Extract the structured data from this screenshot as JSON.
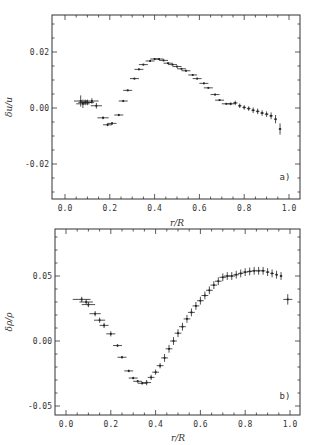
{
  "chart_data": [
    {
      "type": "scatter",
      "panel_label": "a)",
      "title": "",
      "xlabel": "r/R",
      "ylabel": "δu/u",
      "xlim": [
        -0.05,
        1.04
      ],
      "ylim": [
        -0.032,
        0.033
      ],
      "xticks": [
        "0.0",
        "0.2",
        "0.4",
        "0.6",
        "0.8",
        "1.0"
      ],
      "yticks": [
        "-0.02",
        "0.00",
        "0.02"
      ],
      "grid": false,
      "error_bars": true,
      "series": [
        {
          "name": "δu/u",
          "points": [
            {
              "x": 0.07,
              "y": 0.0025,
              "xerr": 0.03,
              "yerr": 0.002
            },
            {
              "x": 0.08,
              "y": 0.0015,
              "xerr": 0.03,
              "yerr": 0.0015
            },
            {
              "x": 0.09,
              "y": 0.002,
              "xerr": 0.03,
              "yerr": 0.001
            },
            {
              "x": 0.1,
              "y": 0.002,
              "xerr": 0.03,
              "yerr": 0.001
            },
            {
              "x": 0.12,
              "y": 0.0025,
              "xerr": 0.03,
              "yerr": 0.001
            },
            {
              "x": 0.14,
              "y": 0.0008,
              "xerr": 0.025,
              "yerr": 0.001
            },
            {
              "x": 0.17,
              "y": -0.0035,
              "xerr": 0.025,
              "yerr": 0.0005
            },
            {
              "x": 0.19,
              "y": -0.006,
              "xerr": 0.02,
              "yerr": 0.0005
            },
            {
              "x": 0.21,
              "y": -0.0055,
              "xerr": 0.02,
              "yerr": 0.0005
            },
            {
              "x": 0.24,
              "y": -0.0025,
              "xerr": 0.02,
              "yerr": 0.0004
            },
            {
              "x": 0.26,
              "y": 0.0025,
              "xerr": 0.02,
              "yerr": 0.0004
            },
            {
              "x": 0.28,
              "y": 0.0063,
              "xerr": 0.02,
              "yerr": 0.0003
            },
            {
              "x": 0.31,
              "y": 0.0105,
              "xerr": 0.02,
              "yerr": 0.0003
            },
            {
              "x": 0.33,
              "y": 0.0138,
              "xerr": 0.02,
              "yerr": 0.0003
            },
            {
              "x": 0.35,
              "y": 0.0155,
              "xerr": 0.02,
              "yerr": 0.0003
            },
            {
              "x": 0.38,
              "y": 0.0168,
              "xerr": 0.02,
              "yerr": 0.0003
            },
            {
              "x": 0.4,
              "y": 0.0175,
              "xerr": 0.02,
              "yerr": 0.0003
            },
            {
              "x": 0.42,
              "y": 0.0175,
              "xerr": 0.02,
              "yerr": 0.0003
            },
            {
              "x": 0.44,
              "y": 0.017,
              "xerr": 0.02,
              "yerr": 0.0003
            },
            {
              "x": 0.46,
              "y": 0.016,
              "xerr": 0.02,
              "yerr": 0.0003
            },
            {
              "x": 0.48,
              "y": 0.0155,
              "xerr": 0.02,
              "yerr": 0.0003
            },
            {
              "x": 0.5,
              "y": 0.0148,
              "xerr": 0.02,
              "yerr": 0.0003
            },
            {
              "x": 0.52,
              "y": 0.014,
              "xerr": 0.02,
              "yerr": 0.0003
            },
            {
              "x": 0.54,
              "y": 0.0133,
              "xerr": 0.02,
              "yerr": 0.0003
            },
            {
              "x": 0.57,
              "y": 0.0118,
              "xerr": 0.02,
              "yerr": 0.0003
            },
            {
              "x": 0.59,
              "y": 0.0105,
              "xerr": 0.02,
              "yerr": 0.0003
            },
            {
              "x": 0.62,
              "y": 0.0088,
              "xerr": 0.02,
              "yerr": 0.0003
            },
            {
              "x": 0.64,
              "y": 0.0072,
              "xerr": 0.02,
              "yerr": 0.0003
            },
            {
              "x": 0.67,
              "y": 0.0048,
              "xerr": 0.02,
              "yerr": 0.0003
            },
            {
              "x": 0.69,
              "y": 0.0028,
              "xerr": 0.02,
              "yerr": 0.0003
            },
            {
              "x": 0.72,
              "y": 0.0015,
              "xerr": 0.02,
              "yerr": 0.0003
            },
            {
              "x": 0.74,
              "y": 0.0015,
              "xerr": 0.015,
              "yerr": 0.0005
            },
            {
              "x": 0.76,
              "y": 0.0018,
              "xerr": 0.01,
              "yerr": 0.0008
            },
            {
              "x": 0.78,
              "y": 0.0008,
              "xerr": 0.008,
              "yerr": 0.0008
            },
            {
              "x": 0.8,
              "y": 0.0002,
              "xerr": 0.008,
              "yerr": 0.0008
            },
            {
              "x": 0.82,
              "y": -0.0002,
              "xerr": 0.008,
              "yerr": 0.0008
            },
            {
              "x": 0.84,
              "y": -0.0008,
              "xerr": 0.008,
              "yerr": 0.001
            },
            {
              "x": 0.86,
              "y": -0.0012,
              "xerr": 0.008,
              "yerr": 0.001
            },
            {
              "x": 0.88,
              "y": -0.0018,
              "xerr": 0.008,
              "yerr": 0.001
            },
            {
              "x": 0.9,
              "y": -0.0022,
              "xerr": 0.008,
              "yerr": 0.001
            },
            {
              "x": 0.92,
              "y": -0.0028,
              "xerr": 0.008,
              "yerr": 0.0012
            },
            {
              "x": 0.94,
              "y": -0.004,
              "xerr": 0.006,
              "yerr": 0.0015
            },
            {
              "x": 0.96,
              "y": -0.0075,
              "xerr": 0.006,
              "yerr": 0.002
            }
          ]
        }
      ]
    },
    {
      "type": "scatter",
      "panel_label": "b)",
      "title": "",
      "xlabel": "r/R",
      "ylabel": "δρ/ρ",
      "xlim": [
        -0.05,
        1.04
      ],
      "ylim": [
        -0.055,
        0.085
      ],
      "xticks": [
        "0.0",
        "0.2",
        "0.4",
        "0.6",
        "0.8",
        "1.0"
      ],
      "yticks": [
        "-0.05",
        "0.00",
        "0.05"
      ],
      "grid": false,
      "error_bars": true,
      "series": [
        {
          "name": "δρ/ρ",
          "points": [
            {
              "x": 0.07,
              "y": 0.032,
              "xerr": 0.04,
              "yerr": 0.002
            },
            {
              "x": 0.09,
              "y": 0.03,
              "xerr": 0.03,
              "yerr": 0.002
            },
            {
              "x": 0.1,
              "y": 0.028,
              "xerr": 0.03,
              "yerr": 0.002
            },
            {
              "x": 0.13,
              "y": 0.021,
              "xerr": 0.025,
              "yerr": 0.002
            },
            {
              "x": 0.15,
              "y": 0.016,
              "xerr": 0.025,
              "yerr": 0.002
            },
            {
              "x": 0.17,
              "y": 0.012,
              "xerr": 0.02,
              "yerr": 0.002
            },
            {
              "x": 0.2,
              "y": 0.0055,
              "xerr": 0.02,
              "yerr": 0.002
            },
            {
              "x": 0.23,
              "y": -0.0035,
              "xerr": 0.02,
              "yerr": 0.001
            },
            {
              "x": 0.25,
              "y": -0.0125,
              "xerr": 0.02,
              "yerr": 0.001
            },
            {
              "x": 0.28,
              "y": -0.023,
              "xerr": 0.02,
              "yerr": 0.001
            },
            {
              "x": 0.3,
              "y": -0.0285,
              "xerr": 0.02,
              "yerr": 0.001
            },
            {
              "x": 0.32,
              "y": -0.031,
              "xerr": 0.02,
              "yerr": 0.001
            },
            {
              "x": 0.34,
              "y": -0.0325,
              "xerr": 0.02,
              "yerr": 0.001
            },
            {
              "x": 0.36,
              "y": -0.032,
              "xerr": 0.02,
              "yerr": 0.002
            },
            {
              "x": 0.38,
              "y": -0.028,
              "xerr": 0.015,
              "yerr": 0.002
            },
            {
              "x": 0.4,
              "y": -0.024,
              "xerr": 0.015,
              "yerr": 0.002
            },
            {
              "x": 0.42,
              "y": -0.019,
              "xerr": 0.015,
              "yerr": 0.002
            },
            {
              "x": 0.44,
              "y": -0.013,
              "xerr": 0.015,
              "yerr": 0.003
            },
            {
              "x": 0.46,
              "y": -0.006,
              "xerr": 0.015,
              "yerr": 0.003
            },
            {
              "x": 0.48,
              "y": 0.0,
              "xerr": 0.015,
              "yerr": 0.003
            },
            {
              "x": 0.5,
              "y": 0.006,
              "xerr": 0.015,
              "yerr": 0.003
            },
            {
              "x": 0.52,
              "y": 0.011,
              "xerr": 0.015,
              "yerr": 0.003
            },
            {
              "x": 0.54,
              "y": 0.017,
              "xerr": 0.015,
              "yerr": 0.003
            },
            {
              "x": 0.56,
              "y": 0.022,
              "xerr": 0.015,
              "yerr": 0.003
            },
            {
              "x": 0.58,
              "y": 0.027,
              "xerr": 0.015,
              "yerr": 0.003
            },
            {
              "x": 0.6,
              "y": 0.031,
              "xerr": 0.015,
              "yerr": 0.003
            },
            {
              "x": 0.62,
              "y": 0.035,
              "xerr": 0.015,
              "yerr": 0.003
            },
            {
              "x": 0.64,
              "y": 0.039,
              "xerr": 0.015,
              "yerr": 0.003
            },
            {
              "x": 0.66,
              "y": 0.043,
              "xerr": 0.015,
              "yerr": 0.003
            },
            {
              "x": 0.68,
              "y": 0.046,
              "xerr": 0.015,
              "yerr": 0.003
            },
            {
              "x": 0.7,
              "y": 0.049,
              "xerr": 0.015,
              "yerr": 0.003
            },
            {
              "x": 0.72,
              "y": 0.05,
              "xerr": 0.015,
              "yerr": 0.003
            },
            {
              "x": 0.74,
              "y": 0.05,
              "xerr": 0.015,
              "yerr": 0.003
            },
            {
              "x": 0.76,
              "y": 0.051,
              "xerr": 0.012,
              "yerr": 0.003
            },
            {
              "x": 0.78,
              "y": 0.052,
              "xerr": 0.012,
              "yerr": 0.003
            },
            {
              "x": 0.8,
              "y": 0.053,
              "xerr": 0.012,
              "yerr": 0.003
            },
            {
              "x": 0.82,
              "y": 0.0535,
              "xerr": 0.012,
              "yerr": 0.003
            },
            {
              "x": 0.84,
              "y": 0.054,
              "xerr": 0.012,
              "yerr": 0.003
            },
            {
              "x": 0.86,
              "y": 0.054,
              "xerr": 0.012,
              "yerr": 0.003
            },
            {
              "x": 0.88,
              "y": 0.054,
              "xerr": 0.01,
              "yerr": 0.003
            },
            {
              "x": 0.9,
              "y": 0.053,
              "xerr": 0.008,
              "yerr": 0.003
            },
            {
              "x": 0.92,
              "y": 0.052,
              "xerr": 0.008,
              "yerr": 0.003
            },
            {
              "x": 0.94,
              "y": 0.051,
              "xerr": 0.006,
              "yerr": 0.003
            },
            {
              "x": 0.96,
              "y": 0.05,
              "xerr": 0.006,
              "yerr": 0.003
            },
            {
              "x": 0.99,
              "y": 0.032,
              "xerr": 0.02,
              "yerr": 0.004
            }
          ]
        }
      ]
    }
  ]
}
